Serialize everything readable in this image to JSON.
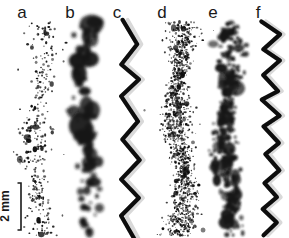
{
  "figure": {
    "background_color": "#ffffff",
    "ink_color": "#111111",
    "ghost_color": "#d9d9d9",
    "width": 289,
    "height": 238,
    "panel_count": 6
  },
  "panels": [
    {
      "label": "a",
      "label_x": 22,
      "label_y": 13,
      "center_x": 40,
      "kind": "fine-sparse-speckle",
      "description": "sparse small discrete dots"
    },
    {
      "label": "b",
      "label_x": 70,
      "label_y": 13,
      "center_x": 86,
      "kind": "coarse-blobs",
      "description": "large irregular blurred blobs"
    },
    {
      "label": "c",
      "label_x": 117,
      "label_y": 13,
      "center_x": 131,
      "kind": "zigzag-trace",
      "description": "low frequency zigzag line with ghost"
    },
    {
      "label": "d",
      "label_x": 162,
      "label_y": 13,
      "center_x": 180,
      "kind": "dense-fine-speckle",
      "description": "very dense fine speckles"
    },
    {
      "label": "e",
      "label_x": 213,
      "label_y": 13,
      "center_x": 228,
      "kind": "medium-blobs",
      "description": "medium clustered blobs"
    },
    {
      "label": "f",
      "label_x": 258,
      "label_y": 13,
      "center_x": 271,
      "kind": "zigzag-trace-dense",
      "description": "high frequency zigzag line with ghost"
    }
  ],
  "scalebar": {
    "text": "2 mm",
    "value": 2,
    "unit": "mm",
    "orientation": "vertical",
    "rotation_deg": -90,
    "x": 21,
    "y_top": 183,
    "y_bottom": 230,
    "cap_half_width": 3.5,
    "text_x": 9,
    "text_y": 206
  },
  "chart_data": {
    "type": "scatter",
    "title": "",
    "xlabel": "",
    "ylabel": "",
    "grid": false,
    "legend": "none",
    "note": "Six vertical panels (a-f) showing particle deposition / trace patterns of increasing density and coarseness; panels c and f are continuous zigzag traces.",
    "panel_labels": [
      "a",
      "b",
      "c",
      "d",
      "e",
      "f"
    ],
    "panel_kinds": [
      "fine-sparse-speckle",
      "coarse-blobs",
      "zigzag-trace",
      "dense-fine-speckle",
      "medium-blobs",
      "zigzag-trace-dense"
    ],
    "relative_density": [
      0.25,
      0.45,
      1.0,
      0.9,
      0.75,
      1.0
    ],
    "scalebar_mm": 2,
    "scalebar_pixels": 47,
    "y_range_px": [
      20,
      236
    ]
  }
}
